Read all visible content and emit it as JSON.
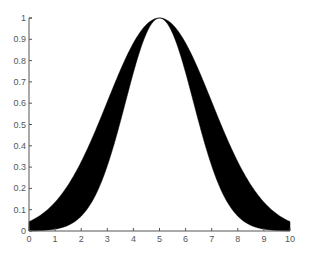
{
  "chart_data": {
    "type": "area",
    "title": "",
    "xlabel": "",
    "ylabel": "",
    "xlim": [
      0,
      10
    ],
    "ylim": [
      0,
      1
    ],
    "grid": false,
    "legend": null,
    "x_ticks": [
      0,
      1,
      2,
      3,
      4,
      5,
      6,
      7,
      8,
      9,
      10
    ],
    "y_ticks": [
      0,
      0.1,
      0.2,
      0.3,
      0.4,
      0.5,
      0.6,
      0.7,
      0.8,
      0.9,
      1
    ],
    "x_tick_labels": [
      "0",
      "1",
      "2",
      "3",
      "4",
      "5",
      "6",
      "7",
      "8",
      "9",
      "10"
    ],
    "y_tick_labels": [
      "0",
      "0.1",
      "0.2",
      "0.3",
      "0.4",
      "0.5",
      "0.6",
      "0.7",
      "0.8",
      "0.9",
      "1"
    ],
    "fill_color": "#000000",
    "x": [
      0,
      0.5,
      1,
      1.5,
      2,
      2.5,
      3,
      3.5,
      4,
      4.5,
      5,
      5.5,
      6,
      6.5,
      7,
      7.5,
      8,
      8.5,
      9,
      9.5,
      10
    ],
    "series": [
      {
        "name": "outer (upper bound)",
        "mu": 5,
        "sigma": 2.0,
        "values": [
          0.04,
          0.08,
          0.14,
          0.22,
          0.32,
          0.46,
          0.61,
          0.75,
          0.88,
          0.97,
          1.0,
          0.97,
          0.88,
          0.75,
          0.61,
          0.46,
          0.32,
          0.22,
          0.14,
          0.08,
          0.04
        ]
      },
      {
        "name": "inner (lower bound)",
        "mu": 5,
        "sigma": 1.3,
        "values": [
          0.0,
          0.001,
          0.01,
          0.03,
          0.07,
          0.16,
          0.31,
          0.51,
          0.74,
          0.93,
          1.0,
          0.93,
          0.74,
          0.51,
          0.31,
          0.16,
          0.07,
          0.03,
          0.01,
          0.001,
          0.0
        ]
      }
    ]
  },
  "axes": {
    "plot_box_px": {
      "left": 29,
      "right": 290,
      "top": 18,
      "bottom": 231
    },
    "axis_color": "#555555"
  }
}
